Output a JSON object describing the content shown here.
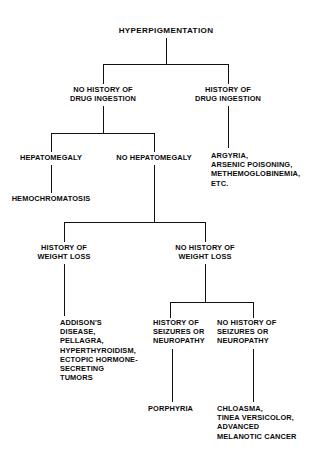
{
  "diagram": {
    "title": "HYPERPIGMENTATION",
    "nodes": {
      "root": "HYPERPIGMENTATION",
      "no_history_drug": "NO HISTORY OF\nDRUG INGESTION",
      "history_drug": "HISTORY OF\nDRUG INGESTION",
      "drug_causes": "ARGYRIA,\nARSENIC POISONING,\nMETHEMOGLOBINEMIA,\nETC.",
      "hepatomegaly": "HEPATOMEGALY",
      "no_hepatomegaly": "NO HEPATOMEGALY",
      "hemochromatosis": "HEMOCHROMATOSIS",
      "history_weight_loss": "HISTORY OF\nWEIGHT LOSS",
      "no_history_weight_loss": "NO HISTORY OF\nWEIGHT LOSS",
      "weight_loss_causes": "ADDISON'S\nDISEASE,\nPELLAGRA,\nHYPERTHYROIDISM,\nECTOPIC HORMONE-\nSECRETING\nTUMORS",
      "history_seizures": "HISTORY OF\nSEIZURES OR\nNEUROPATHY",
      "no_history_seizures": "NO HISTORY OF\nSEIZURES OR\nNEUROPATHY",
      "porphyria": "PORPHYRIA",
      "skin_causes": "CHLOASMA,\nTINEA VERSICOLOR,\nADVANCED\nMELANOTIC CANCER"
    },
    "colors": {
      "background": "#ffffff",
      "text": "#0a0a0a",
      "connector": "#111111"
    }
  }
}
